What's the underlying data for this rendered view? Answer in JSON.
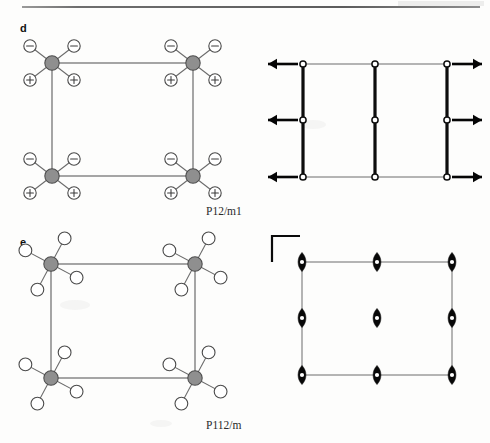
{
  "figure": {
    "type": "crystallographic-symmetry-figure",
    "panels": [
      {
        "letter": "d",
        "caption": "P12/m1",
        "structure": {
          "description": "Square unit cell with gray metal atoms at the four corners; each metal carries four ligands drawn as small circles, the two upper ligands labelled with a minus sign and the two lower ligands labelled with a plus sign.",
          "metal_color": "#8f8f8f",
          "ligand_color": "#ffffff",
          "ligand_labels_top": "−",
          "ligand_labels_bottom": "+",
          "cell": {
            "x0": 52,
            "y0": 63,
            "x1": 193,
            "y1": 176
          },
          "metal_sites": [
            {
              "cx": 52,
              "cy": 63
            },
            {
              "cx": 193,
              "cy": 63
            },
            {
              "cx": 52,
              "cy": 176
            },
            {
              "cx": 193,
              "cy": 176
            }
          ],
          "ligand_offsets": [
            {
              "dx": -22,
              "dy": -17,
              "charge": "minus"
            },
            {
              "dx": 22,
              "dy": -17,
              "charge": "minus"
            },
            {
              "dx": -22,
              "dy": 17,
              "charge": "plus"
            },
            {
              "dx": 22,
              "dy": 17,
              "charge": "plus"
            }
          ]
        },
        "symmetry": {
          "description": "Mirror planes shown as heavy vertical lines at x = 0, 1/2 and 1; inversion centres as small open circles; arrows along the horizontal axis pointing outward on both sides.",
          "frame": {
            "x0": 303,
            "y0": 64,
            "x1": 447,
            "y1": 177
          },
          "mirror_x": [
            303,
            375,
            447
          ],
          "inversion_centers_x": [
            303,
            375,
            447
          ],
          "inversion_centers_y": [
            64,
            120,
            177
          ],
          "arrows_left_x": [
            268,
            298
          ],
          "arrows_right_x": [
            452,
            482
          ],
          "arrow_rows_y": [
            64,
            120,
            177
          ],
          "arrow_direction_left": "left",
          "arrow_direction_right": "right"
        }
      },
      {
        "letter": "e",
        "caption": "P112/m",
        "structure": {
          "description": "Square unit cell with gray metal atoms at the four corners; each metal carries four open-circle ligands rotated away from the cell axes in a pinwheel arrangement, no charge labels.",
          "metal_color": "#8f8f8f",
          "ligand_color": "#ffffff",
          "cell": {
            "x0": 51,
            "y0": 264,
            "x1": 195,
            "y1": 378
          },
          "metal_sites": [
            {
              "cx": 51,
              "cy": 264
            },
            {
              "cx": 195,
              "cy": 264
            },
            {
              "cx": 51,
              "cy": 378
            },
            {
              "cx": 195,
              "cy": 378
            }
          ],
          "ligand_angles_deg": [
            62,
            152,
            242,
            332
          ],
          "ligand_radius": 29
        },
        "symmetry": {
          "description": "Two-fold rotation axes perpendicular to the page combined with a mirror plane, drawn as filled pointed ovals with a white inversion dot, on a three-by-three net; an L-shaped axis marker sits at the upper left.",
          "frame": {
            "x0": 302,
            "y0": 262,
            "x1": 452,
            "y1": 375
          },
          "axis_x": [
            302,
            377,
            452
          ],
          "axis_y": [
            262,
            318,
            375
          ],
          "axis_symbol": "two-fold-axis-with-inversion-center",
          "corner_marker": {
            "x": 272,
            "y": 236,
            "w": 28,
            "h": 26
          }
        }
      }
    ]
  },
  "colors": {
    "metal": "#8f8f8f",
    "ligand_fill": "#ffffff",
    "outline": "#4a4a4a",
    "cell_edge": "#5d5d5d",
    "symmetry_black": "#0a0a0a",
    "background": "#fdfdfc"
  }
}
